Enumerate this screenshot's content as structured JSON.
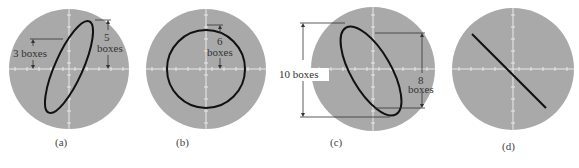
{
  "figure": {
    "colors": {
      "screen": "#a9a9a9",
      "trace": "#111111",
      "graticule": "#f2f2f2",
      "dimension": "#333333",
      "background": "#ffffff"
    },
    "panels": [
      {
        "id": "a",
        "caption": "(a)",
        "trace": "ellipse tilted right",
        "annotations": [
          {
            "id": "a-left",
            "text_line1": "3 boxes"
          },
          {
            "id": "a-right",
            "text_line1": "5",
            "text_line2": "boxes"
          }
        ]
      },
      {
        "id": "b",
        "caption": "(b)",
        "trace": "circle",
        "annotations": [
          {
            "id": "b-top",
            "text_line1": "6",
            "text_line2": "boxes"
          }
        ]
      },
      {
        "id": "c",
        "caption": "(c)",
        "trace": "ellipse tilted left",
        "annotations": [
          {
            "id": "c-left",
            "text_line1": "10 boxes"
          },
          {
            "id": "c-right",
            "text_line1": "8",
            "text_line2": "boxes"
          }
        ]
      },
      {
        "id": "d",
        "caption": "(d)",
        "trace": "straight line, negative slope",
        "annotations": []
      }
    ]
  }
}
